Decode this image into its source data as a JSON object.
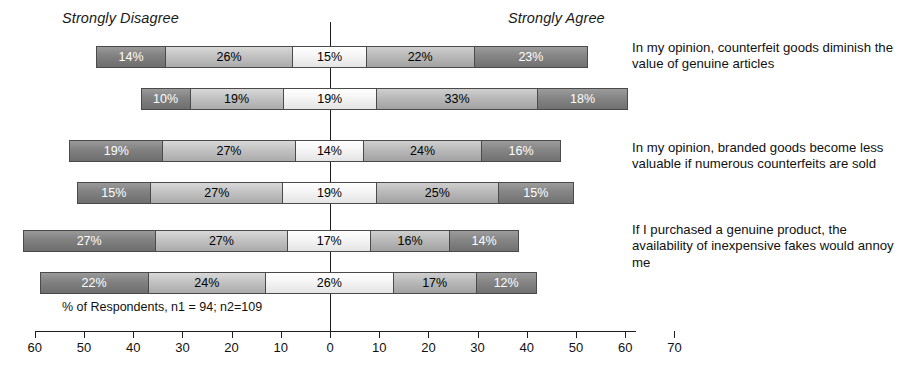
{
  "header": {
    "left_label": "Strongly Disagree",
    "right_label": "Strongly Agree"
  },
  "footnote": "% of Respondents, n1 = 94; n2=109",
  "axis": {
    "ticks": [
      {
        "label": "60",
        "value": -60
      },
      {
        "label": "50",
        "value": -50
      },
      {
        "label": "40",
        "value": -40
      },
      {
        "label": "30",
        "value": -30
      },
      {
        "label": "20",
        "value": -20
      },
      {
        "label": "10",
        "value": -10
      },
      {
        "label": "0",
        "value": 0
      },
      {
        "label": "10",
        "value": 10
      },
      {
        "label": "20",
        "value": 20
      },
      {
        "label": "30",
        "value": 30
      },
      {
        "label": "40",
        "value": 40
      },
      {
        "label": "50",
        "value": 50
      },
      {
        "label": "60",
        "value": 60
      },
      {
        "label": "70",
        "value": 70
      }
    ]
  },
  "statements": [
    "In my opinion, counterfeit goods diminish the value of genuine articles",
    "In my opinion, branded goods become less valuable if numerous counterfeits are sold",
    "If I purchased a genuine product, the availability of inexpensive fakes would annoy me"
  ],
  "chart_data": {
    "type": "bar",
    "subtype": "diverging-stacked-bar",
    "title": "",
    "xlabel": "% of Respondents, n1 = 94; n2=109",
    "ylabel": "",
    "xlim": [
      -60,
      70
    ],
    "grid": false,
    "legend_position": "none",
    "categories": [
      "In my opinion, counterfeit goods diminish the value of genuine articles",
      "In my opinion, branded goods become less valuable if numerous counterfeits are sold",
      "If I purchased a genuine product, the availability of inexpensive fakes would annoy me"
    ],
    "response_levels": [
      "Strongly Disagree",
      "Disagree",
      "Neutral",
      "Agree",
      "Strongly Agree"
    ],
    "annotations": [
      "Strongly Disagree",
      "Strongly Agree"
    ],
    "series": [
      {
        "name": "Sample 1 (n1 = 94)",
        "bars": [
          {
            "category_index": 0,
            "values": [
              14,
              26,
              15,
              22,
              23
            ],
            "labels": [
              "14%",
              "26%",
              "15%",
              "22%",
              "23%"
            ]
          },
          {
            "category_index": 1,
            "values": [
              19,
              27,
              14,
              24,
              16
            ],
            "labels": [
              "19%",
              "27%",
              "14%",
              "24%",
              "16%"
            ]
          },
          {
            "category_index": 2,
            "values": [
              27,
              27,
              17,
              16,
              14
            ],
            "labels": [
              "27%",
              "27%",
              "17%",
              "16%",
              "14%"
            ]
          }
        ]
      },
      {
        "name": "Sample 2 (n2 = 109)",
        "bars": [
          {
            "category_index": 0,
            "values": [
              10,
              19,
              19,
              33,
              18
            ],
            "labels": [
              "10%",
              "19%",
              "19%",
              "33%",
              "18%"
            ]
          },
          {
            "category_index": 1,
            "values": [
              15,
              27,
              19,
              25,
              15
            ],
            "labels": [
              "15%",
              "27%",
              "19%",
              "25%",
              "15%"
            ]
          },
          {
            "category_index": 2,
            "values": [
              22,
              24,
              26,
              17,
              12
            ],
            "labels": [
              "22%",
              "24%",
              "26%",
              "17%",
              "12%"
            ]
          }
        ]
      }
    ],
    "bars_in_draw_order": [
      {
        "row": 0,
        "series": 0,
        "values": [
          14,
          26,
          15,
          22,
          23
        ],
        "labels": [
          "14%",
          "26%",
          "15%",
          "22%",
          "23%"
        ]
      },
      {
        "row": 1,
        "series": 1,
        "values": [
          10,
          19,
          19,
          33,
          18
        ],
        "labels": [
          "10%",
          "19%",
          "19%",
          "33%",
          "18%"
        ]
      },
      {
        "row": 2,
        "series": 0,
        "values": [
          19,
          27,
          14,
          24,
          16
        ],
        "labels": [
          "19%",
          "27%",
          "14%",
          "24%",
          "16%"
        ]
      },
      {
        "row": 3,
        "series": 1,
        "values": [
          15,
          27,
          19,
          25,
          15
        ],
        "labels": [
          "15%",
          "27%",
          "19%",
          "25%",
          "15%"
        ]
      },
      {
        "row": 4,
        "series": 0,
        "values": [
          27,
          27,
          17,
          16,
          14
        ],
        "labels": [
          "27%",
          "27%",
          "17%",
          "16%",
          "14%"
        ]
      },
      {
        "row": 5,
        "series": 1,
        "values": [
          22,
          24,
          26,
          17,
          12
        ],
        "labels": [
          "22%",
          "24%",
          "26%",
          "17%",
          "12%"
        ]
      }
    ],
    "colors": {
      "strongly_disagree": "#828282",
      "disagree": "#c2c2c2",
      "neutral": "#f6f6f6",
      "agree": "#b9b9b9",
      "strongly_agree": "#868686",
      "axis": "#1d1d1d",
      "border": "#4a4a4a"
    }
  }
}
